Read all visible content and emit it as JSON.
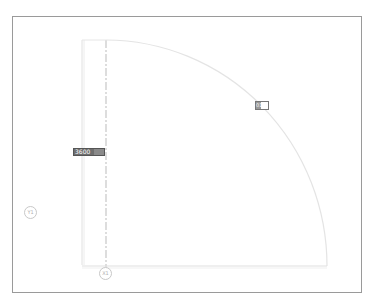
{
  "view": {
    "type": "cad-plan-view",
    "frame_color": "#9a9a9a",
    "line_color": "#e0e0e0"
  },
  "tags": {
    "dimension_tag": {
      "label": "3600"
    },
    "small_tag": {
      "label": "01"
    }
  },
  "grid_bubbles": {
    "y": {
      "label": "Y1"
    },
    "x": {
      "label": "X1"
    }
  }
}
